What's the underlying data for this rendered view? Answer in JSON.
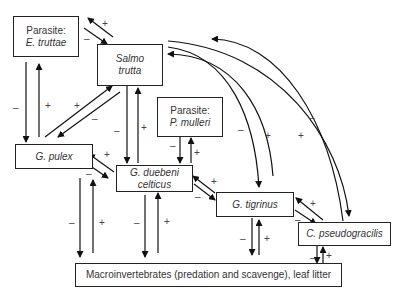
{
  "diagram": {
    "type": "food-web",
    "nodes": {
      "e_truttae": {
        "line1": "Parasite:",
        "line2": "E. truttae"
      },
      "salmo": {
        "line1": "Salmo",
        "line2": "trutta"
      },
      "p_mulleri": {
        "line1": "Parasite:",
        "line2": "P. mulleri"
      },
      "g_pulex": {
        "line1": "G. pulex"
      },
      "g_duebeni": {
        "line1": "G. duebeni",
        "line2": "celticus"
      },
      "g_tigrinus": {
        "line1": "G. tigrinus"
      },
      "c_pseudo": {
        "line1": "C. pseudogracilis"
      },
      "macro": {
        "line1": "Macroinvertebrates (predation and scavenge), leaf litter"
      }
    },
    "signs": {
      "plus": "+",
      "minus": "–"
    },
    "edges": [
      {
        "from": "Salmo trutta",
        "to": "E. truttae",
        "sign": "+"
      },
      {
        "from": "E. truttae",
        "to": "Salmo trutta",
        "sign": "–"
      },
      {
        "from": "E. truttae",
        "to": "G. pulex",
        "sign": "–"
      },
      {
        "from": "G. pulex",
        "to": "E. truttae",
        "sign": "+"
      },
      {
        "from": "G. pulex",
        "to": "Salmo trutta",
        "sign": "+"
      },
      {
        "from": "Salmo trutta",
        "to": "G. pulex",
        "sign": "–"
      },
      {
        "from": "Salmo trutta",
        "to": "G. duebeni celticus",
        "sign": "–"
      },
      {
        "from": "G. duebeni celticus",
        "to": "Salmo trutta",
        "sign": "+"
      },
      {
        "from": "P. mulleri",
        "to": "G. duebeni celticus",
        "sign": "–"
      },
      {
        "from": "G. duebeni celticus",
        "to": "P. mulleri",
        "sign": "+"
      },
      {
        "from": "G. duebeni celticus",
        "to": "G. pulex",
        "sign": "+"
      },
      {
        "from": "G. pulex",
        "to": "G. duebeni celticus",
        "sign": "–"
      },
      {
        "from": "G. tigrinus",
        "to": "G. duebeni celticus",
        "sign": "+"
      },
      {
        "from": "G. duebeni celticus",
        "to": "G. tigrinus",
        "sign": "–"
      },
      {
        "from": "Salmo trutta",
        "to": "G. tigrinus",
        "sign": "–"
      },
      {
        "from": "G. tigrinus",
        "to": "Salmo trutta",
        "sign": "+"
      },
      {
        "from": "Salmo trutta",
        "to": "C. pseudogracilis",
        "sign": "–"
      },
      {
        "from": "C. pseudogracilis",
        "to": "Salmo trutta",
        "sign": "+"
      },
      {
        "from": "C. pseudogracilis",
        "to": "G. tigrinus",
        "sign": "+"
      },
      {
        "from": "G. tigrinus",
        "to": "C. pseudogracilis",
        "sign": "–"
      },
      {
        "from": "G. pulex",
        "to": "Macroinvertebrates",
        "sign": "–"
      },
      {
        "from": "Macroinvertebrates",
        "to": "G. pulex",
        "sign": "+"
      },
      {
        "from": "G. duebeni celticus",
        "to": "Macroinvertebrates",
        "sign": "–"
      },
      {
        "from": "Macroinvertebrates",
        "to": "G. duebeni celticus",
        "sign": "+"
      },
      {
        "from": "G. tigrinus",
        "to": "Macroinvertebrates",
        "sign": "–"
      },
      {
        "from": "Macroinvertebrates",
        "to": "G. tigrinus",
        "sign": "+"
      },
      {
        "from": "C. pseudogracilis",
        "to": "Macroinvertebrates",
        "sign": "–"
      },
      {
        "from": "Macroinvertebrates",
        "to": "C. pseudogracilis",
        "sign": "+"
      }
    ]
  }
}
